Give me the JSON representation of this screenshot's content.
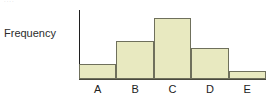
{
  "figure": {
    "top_edge_remnant": "····",
    "y_axis_title": "Frequency"
  },
  "chart_data": {
    "type": "bar",
    "title": "",
    "subtitle": "",
    "xlabel": "",
    "ylabel": "Frequency",
    "categories": [
      "A",
      "B",
      "C",
      "D",
      "E"
    ],
    "values": [
      2,
      5,
      8,
      4,
      1
    ],
    "ylim": [
      0,
      9
    ],
    "xlim": [
      0,
      5
    ],
    "grid": false,
    "legend": null,
    "legend_position": "none",
    "y_tick_labels": [],
    "x_tick_labels": [
      "A",
      "B",
      "C",
      "D",
      "E"
    ],
    "annotations": [],
    "bar_fill_color": "#e8e9c0",
    "bar_edge_color": "#6f705c",
    "axis_color": "#1f1f1f",
    "bar_gap": 0,
    "note": "Histogram-style adjacent bars; y-axis unlabelled with no tick marks, heights read relative to each other."
  }
}
